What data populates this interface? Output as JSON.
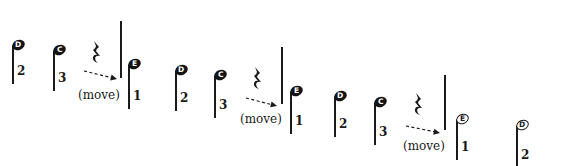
{
  "diagram": {
    "type": "music-notation-sequence",
    "colors": {
      "ink": "#1a1a1a",
      "background": "#ffffff"
    },
    "phrases": [
      {
        "notes": [
          {
            "name": "D",
            "finger": "2",
            "x": 12,
            "y": 40,
            "stem": 38,
            "filled": true
          },
          {
            "name": "C",
            "finger": "3",
            "x": 53,
            "y": 45,
            "stem": 40,
            "filled": true
          }
        ],
        "rest": {
          "x": 92,
          "y": 41
        },
        "arrow": {
          "x1": 84,
          "y1": 71,
          "x2": 117,
          "y2": 79
        },
        "move_label": {
          "text": "(move)",
          "x": 78,
          "y": 89
        },
        "barline": {
          "x": 120,
          "y1": 21,
          "y2": 78
        },
        "after": {
          "name": "E",
          "finger": "1",
          "x": 128,
          "y": 59,
          "stem": 44,
          "filled": true
        }
      },
      {
        "notes": [
          {
            "name": "D",
            "finger": "2",
            "x": 175,
            "y": 65,
            "stem": 40,
            "filled": true
          },
          {
            "name": "C",
            "finger": "3",
            "x": 214,
            "y": 70,
            "stem": 42,
            "filled": true
          }
        ],
        "rest": {
          "x": 253,
          "y": 67
        },
        "arrow": {
          "x1": 246,
          "y1": 98,
          "x2": 277,
          "y2": 106
        },
        "move_label": {
          "text": "(move)",
          "x": 240,
          "y": 113
        },
        "barline": {
          "x": 281,
          "y1": 47,
          "y2": 104
        },
        "after": {
          "name": "E",
          "finger": "1",
          "x": 290,
          "y": 86,
          "stem": 42,
          "filled": true
        }
      },
      {
        "notes": [
          {
            "name": "D",
            "finger": "2",
            "x": 334,
            "y": 91,
            "stem": 40,
            "filled": true
          },
          {
            "name": "C",
            "finger": "3",
            "x": 374,
            "y": 97,
            "stem": 42,
            "filled": true
          }
        ],
        "rest": {
          "x": 414,
          "y": 93
        },
        "arrow": {
          "x1": 406,
          "y1": 126,
          "x2": 440,
          "y2": 133
        },
        "move_label": {
          "text": "(move)",
          "x": 403,
          "y": 140
        },
        "barline": {
          "x": 444,
          "y1": 75,
          "y2": 130
        },
        "after": {
          "name": "E",
          "finger": "1",
          "x": 456,
          "y": 114,
          "stem": 40,
          "filled": false
        }
      }
    ],
    "final_note": {
      "name": "D",
      "finger": "2",
      "x": 516,
      "y": 120,
      "stem": 42,
      "filled": false
    }
  }
}
